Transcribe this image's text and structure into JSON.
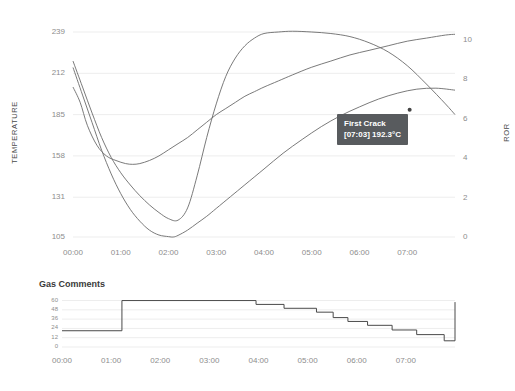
{
  "chart_data": [
    {
      "type": "line",
      "title": "",
      "xlabel": "",
      "ylabel": "TEMPERATURE",
      "y2label": "ROR",
      "xtick_labels": [
        "00:00",
        "01:00",
        "02:00",
        "03:00",
        "04:00",
        "05:00",
        "06:00",
        "07:00"
      ],
      "xlim": [
        0,
        8.0
      ],
      "ylim": [
        105,
        239
      ],
      "ytick_labels": [
        "239",
        "212",
        "185",
        "158",
        "131",
        "105"
      ],
      "ytick_values": [
        239,
        212,
        185,
        158,
        131,
        105
      ],
      "y2lim": [
        0,
        10.4
      ],
      "y2tick_labels": [
        "10",
        "8",
        "6",
        "4",
        "2",
        "0"
      ],
      "y2tick_values": [
        10,
        8,
        6,
        4,
        2,
        0
      ],
      "grid": true,
      "legend": "none",
      "series": [
        {
          "name": "Bean Temperature",
          "axis": "left",
          "color": "#6b6b6b",
          "x": [
            0.0,
            0.15,
            0.3,
            0.5,
            0.7,
            0.9,
            1.1,
            1.25,
            1.4,
            1.6,
            1.8,
            2.0,
            2.2,
            2.4,
            2.6,
            2.8,
            3.0,
            3.2,
            3.4,
            3.6,
            3.8,
            4.0,
            4.3,
            4.6,
            5.0,
            5.4,
            5.8,
            6.2,
            6.6,
            7.0,
            7.4,
            7.8,
            8.0
          ],
          "y": [
            203,
            193,
            178,
            165,
            158,
            155,
            153,
            152.5,
            153,
            155,
            158,
            162,
            166,
            170,
            175,
            180,
            185,
            189,
            193,
            197,
            200,
            203,
            207,
            211,
            216,
            220,
            224,
            227,
            230,
            233,
            235,
            237,
            237.5
          ]
        },
        {
          "name": "Environment Temperature",
          "axis": "left",
          "color": "#6b6b6b",
          "x": [
            0.0,
            0.2,
            0.4,
            0.6,
            0.8,
            1.0,
            1.2,
            1.4,
            1.6,
            1.8,
            2.0,
            2.2,
            2.4,
            2.6,
            2.8,
            3.0,
            3.2,
            3.4,
            3.6,
            3.8,
            4.0,
            4.3,
            4.6,
            5.0,
            5.4,
            5.8,
            6.2,
            6.6,
            7.0,
            7.4,
            7.8,
            8.0
          ],
          "y": [
            220,
            203,
            186,
            170,
            157,
            147,
            139,
            132,
            126,
            121,
            117,
            116,
            124,
            145,
            170,
            192,
            210,
            222,
            230,
            235,
            238,
            239,
            239.5,
            239,
            238,
            236,
            232,
            226,
            217,
            205,
            192,
            185
          ]
        },
        {
          "name": "Rate of Rise (ROR)",
          "axis": "right",
          "color": "#6b6b6b",
          "x": [
            0.0,
            0.2,
            0.4,
            0.6,
            0.8,
            1.0,
            1.2,
            1.4,
            1.6,
            1.8,
            2.0,
            2.1,
            2.2,
            2.4,
            2.6,
            2.8,
            3.0,
            3.3,
            3.6,
            4.0,
            4.4,
            4.8,
            5.2,
            5.6,
            6.0,
            6.4,
            6.8,
            7.2,
            7.6,
            8.0
          ],
          "y": [
            8.6,
            7.2,
            5.8,
            4.4,
            3.2,
            2.2,
            1.4,
            0.8,
            0.35,
            0.1,
            0.02,
            0.0,
            0.08,
            0.35,
            0.7,
            1.05,
            1.45,
            2.05,
            2.65,
            3.45,
            4.25,
            4.95,
            5.6,
            6.15,
            6.6,
            7.0,
            7.3,
            7.5,
            7.55,
            7.45
          ]
        }
      ],
      "annotation": {
        "name": "first-crack-marker",
        "label": "First Crack",
        "value_text": "[07:03] 192.3°C",
        "time": "07:03",
        "temperature": "192.3°C",
        "marker_x": 7.05,
        "marker_ror": 6.45,
        "background_color": "#585b5e",
        "text_color": "#ffffff"
      }
    },
    {
      "type": "line",
      "title": "Gas Comments",
      "xlabel": "",
      "ylabel": "",
      "xtick_labels": [
        "00:00",
        "01:00",
        "02:00",
        "03:00",
        "04:00",
        "05:00",
        "06:00",
        "07:00"
      ],
      "xlim": [
        0,
        8.0
      ],
      "ylim": [
        0,
        62
      ],
      "ytick_labels": [
        "60",
        "48",
        "36",
        "24",
        "12",
        "0"
      ],
      "ytick_values": [
        60,
        48,
        36,
        24,
        12,
        0
      ],
      "grid": true,
      "legend": "none",
      "step_style": "post",
      "color": "#4a4a4a",
      "series": [
        {
          "name": "Gas Setting",
          "color": "#4a4a4a",
          "x": [
            0.0,
            1.22,
            3.95,
            4.52,
            5.18,
            5.52,
            5.82,
            6.22,
            6.72,
            7.22,
            7.78,
            7.9,
            8.0
          ],
          "y": [
            21,
            60,
            55,
            50,
            45,
            38,
            33,
            28,
            22,
            16,
            8,
            8,
            58
          ]
        }
      ]
    }
  ],
  "main_chart": {
    "y_axis_title": "TEMPERATURE",
    "y2_axis_title": "ROR",
    "y_ticks": [
      "239",
      "212",
      "185",
      "158",
      "131",
      "105"
    ],
    "y2_ticks": [
      "10",
      "8",
      "6",
      "4",
      "2",
      "0"
    ],
    "x_ticks": [
      "00:00",
      "01:00",
      "02:00",
      "03:00",
      "04:00",
      "05:00",
      "06:00",
      "07:00"
    ],
    "tooltip": {
      "title": "First Crack",
      "detail": "[07:03] 192.3°C"
    }
  },
  "gas_chart": {
    "title": "Gas Comments",
    "y_ticks": [
      "60",
      "48",
      "36",
      "24",
      "12",
      "0"
    ],
    "x_ticks": [
      "00:00",
      "01:00",
      "02:00",
      "03:00",
      "04:00",
      "05:00",
      "06:00",
      "07:00"
    ]
  },
  "colors": {
    "background": "#ffffff",
    "line": "#6b6b6b",
    "grid": "#ededed",
    "tick_text": "#8d8d8d",
    "tooltip_bg": "#585b5e"
  }
}
